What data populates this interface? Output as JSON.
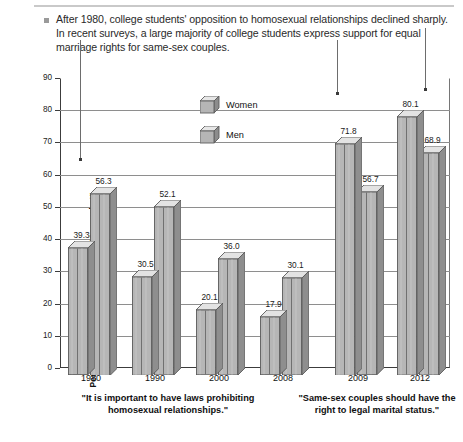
{
  "header": {
    "bullet_icon": "square-bullet",
    "text": "After 1980, college students' opposition to homosexual relationships declined sharply. In recent surveys, a large majority of college students express support for equal marriage rights for same-sex couples."
  },
  "chart_data": {
    "type": "bar",
    "title": "",
    "xlabel": "",
    "ylabel": "Percentage Agreeing \"Strongly\" or \"Somewhat\"",
    "ylim": [
      0,
      90
    ],
    "ytick_labels": [
      "0",
      "10",
      "20",
      "30",
      "40",
      "50",
      "60",
      "70",
      "80",
      "90"
    ],
    "ytick_values": [
      0,
      10,
      20,
      30,
      40,
      50,
      60,
      70,
      80,
      90
    ],
    "grid": true,
    "grid_axis": "y",
    "legend_position": "inside-top-center",
    "categories": [
      "1980",
      "1990",
      "2000",
      "2008",
      "2009",
      "2012"
    ],
    "series": [
      {
        "name": "Women",
        "values": [
          39.3,
          30.5,
          20.1,
          17.9,
          71.8,
          80.1
        ],
        "labels": [
          "39.3",
          "30.5",
          "20.1",
          "17.9",
          "71.8",
          "80.1"
        ]
      },
      {
        "name": "Men",
        "values": [
          56.3,
          52.1,
          36.0,
          30.1,
          56.7,
          68.9
        ],
        "labels": [
          "56.3",
          "52.1",
          "36.0",
          "30.1",
          "56.7",
          "68.9"
        ]
      }
    ],
    "group_captions": [
      {
        "text": "\"It is important to have laws prohibiting homosexual relationships.\"",
        "covers": [
          "1980",
          "1990",
          "2000",
          "2008"
        ]
      },
      {
        "text": "\"Same-sex couples should have the right to legal marital status.\"",
        "covers": [
          "2009",
          "2012"
        ]
      }
    ],
    "annotations": [
      {
        "name": "pointer-1980",
        "target_category": "1980"
      },
      {
        "name": "pointer-2009",
        "target_category": "2009"
      },
      {
        "name": "pointer-2012",
        "target_category": "2012"
      }
    ]
  }
}
